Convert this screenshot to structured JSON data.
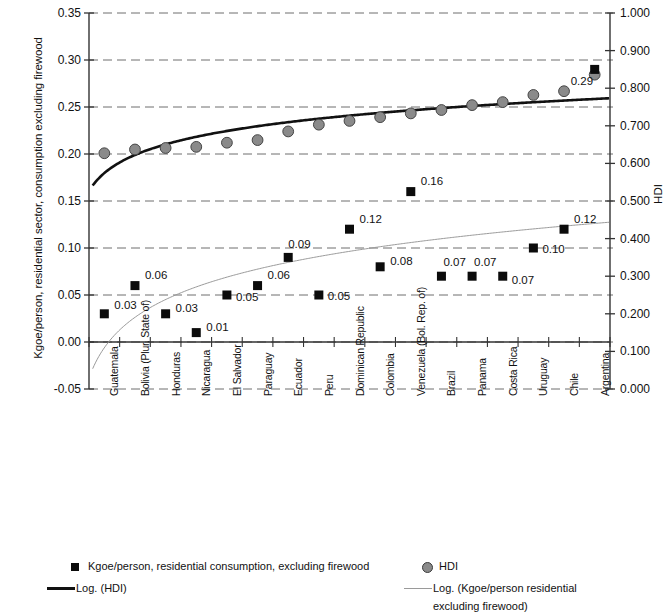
{
  "chart_data": {
    "type": "scatter",
    "title": "",
    "xlabel": "",
    "ylabel": "Kgoe/person, residential sector, consumption excluding firewood",
    "y2label": "HDI",
    "ylim": [
      -0.05,
      0.35
    ],
    "y2lim": [
      0.0,
      1.0
    ],
    "grid": true,
    "legend_position": "bottom",
    "categories": [
      "Guatemala",
      "Bolivia (Plur. State of)",
      "Honduras",
      "Nicaragua",
      "El Salvador",
      "Paraguay",
      "Ecuador",
      "Peru",
      "Dominican Republic",
      "Colombia",
      "Venezuela (Bol. Rep. of)",
      "Brazil",
      "Panama",
      "Costa Rica",
      "Uruguay",
      "Chile",
      "Argentina"
    ],
    "yticks": [
      "-0.05",
      "0.00",
      "0.05",
      "0.10",
      "0.15",
      "0.20",
      "0.25",
      "0.30",
      "0.35"
    ],
    "y2ticks": [
      "0.000",
      "0.100",
      "0.200",
      "0.300",
      "0.400",
      "0.500",
      "0.600",
      "0.700",
      "0.800",
      "0.900",
      "1.000"
    ],
    "series": [
      {
        "name": "Kgoe/person, residential consumption, excluding firewood",
        "marker": "square",
        "axis": "left",
        "color": "#0b0b0b",
        "values": [
          0.03,
          0.06,
          0.03,
          0.01,
          0.05,
          0.06,
          0.09,
          0.05,
          0.12,
          0.08,
          0.16,
          0.07,
          0.07,
          0.07,
          0.1,
          0.12,
          0.29
        ],
        "labels": [
          "0.03",
          "0.06",
          "0.03",
          "0.01",
          "0.05",
          "0.06",
          "0.09",
          "0.05",
          "0.12",
          "0.08",
          "0.16",
          "0.07",
          "0.07",
          "0.07",
          "0.10",
          "0.12",
          "0.29"
        ]
      },
      {
        "name": "HDI",
        "marker": "circle",
        "axis": "right",
        "color": "#8a8a8a",
        "values": [
          0.627,
          0.637,
          0.641,
          0.644,
          0.655,
          0.662,
          0.685,
          0.703,
          0.713,
          0.723,
          0.733,
          0.742,
          0.755,
          0.763,
          0.782,
          0.792,
          0.836
        ]
      }
    ],
    "trendlines": [
      {
        "name": "Log. (HDI)",
        "axis": "right",
        "color": "#111111",
        "width": 2.6
      },
      {
        "name": "Log. (Kgoe/person residential excluding firewood)",
        "axis": "left",
        "color": "#9a9a9a",
        "width": 1
      }
    ]
  },
  "legend": {
    "items": [
      {
        "id": "kgoe",
        "marker": "square-marker",
        "label": "Kgoe/person, residential consumption, excluding firewood"
      },
      {
        "id": "hdi",
        "marker": "circle-marker",
        "label": "HDI"
      },
      {
        "id": "log_hdi",
        "marker": "dark-line",
        "label": "Log. (HDI)"
      },
      {
        "id": "log_kgoe_line1",
        "marker": "gray-line",
        "label": "Log. (Kgoe/person residential"
      },
      {
        "id": "log_kgoe_line2",
        "marker": "none",
        "label": "excluding firewood)"
      }
    ]
  }
}
